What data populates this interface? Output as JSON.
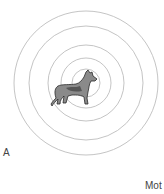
{
  "figure": {
    "panel_label": "A",
    "corner_text": "Mot",
    "rings": [
      {
        "r": 72,
        "color": "#bdbdbd"
      },
      {
        "r": 57,
        "color": "#bdbdbd"
      },
      {
        "r": 38,
        "color": "#bdbdbd"
      },
      {
        "r": 25,
        "color": "#bdbdbd"
      },
      {
        "r": 14,
        "color": "#bdbdbd"
      }
    ],
    "center": {
      "x": 86,
      "y": 83
    }
  }
}
